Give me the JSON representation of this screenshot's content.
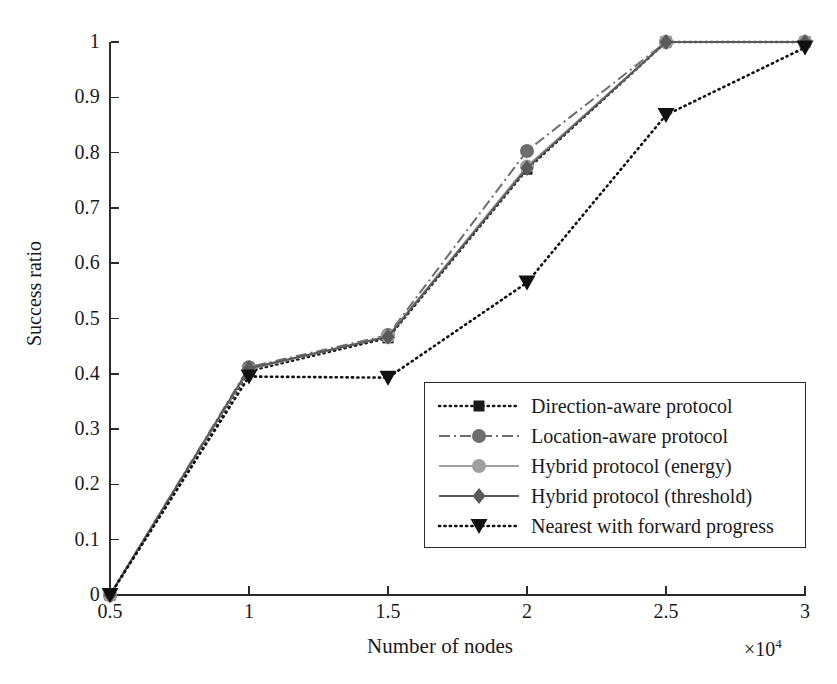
{
  "chart_data": {
    "type": "line",
    "title": "",
    "xlabel": "Number of nodes",
    "ylabel": "Success ratio",
    "x_exponent": "×10",
    "x_exponent_power": "4",
    "xlim": [
      0.5,
      3
    ],
    "ylim": [
      0,
      1
    ],
    "xticks": [
      "0.5",
      "1",
      "1.5",
      "2",
      "2.5",
      "3"
    ],
    "xtick_values": [
      0.5,
      1,
      1.5,
      2,
      2.5,
      3
    ],
    "yticks": [
      "0",
      "0.1",
      "0.2",
      "0.3",
      "0.4",
      "0.5",
      "0.6",
      "0.7",
      "0.8",
      "0.9",
      "1"
    ],
    "ytick_values": [
      0,
      0.1,
      0.2,
      0.3,
      0.4,
      0.5,
      0.6,
      0.7,
      0.8,
      0.9,
      1
    ],
    "grid": false,
    "legend_position": "lower right",
    "x": [
      0.5,
      1,
      1.5,
      2,
      2.5,
      3
    ],
    "series": [
      {
        "name": "Direction-aware protocol",
        "values": [
          0.0,
          0.405,
          0.465,
          0.77,
          1.0,
          1.0
        ],
        "color": "#1a1a1a",
        "marker": "square",
        "linestyle": "dotted"
      },
      {
        "name": "Location-aware protocol",
        "values": [
          0.0,
          0.412,
          0.47,
          0.803,
          1.0,
          1.0
        ],
        "color": "#6e6e6e",
        "marker": "circle",
        "linestyle": "dashdot"
      },
      {
        "name": "Hybrid protocol (energy)",
        "values": [
          0.0,
          0.408,
          0.468,
          0.775,
          1.0,
          1.0
        ],
        "color": "#9f9f9f",
        "marker": "circle",
        "linestyle": "solid"
      },
      {
        "name": "Hybrid protocol (threshold)",
        "values": [
          0.0,
          0.41,
          0.467,
          0.772,
          1.0,
          1.0
        ],
        "color": "#5a5a5a",
        "marker": "diamond",
        "linestyle": "solid"
      },
      {
        "name": "Nearest with forward progress",
        "values": [
          0.0,
          0.395,
          0.393,
          0.565,
          0.868,
          0.99
        ],
        "color": "#111111",
        "marker": "triangle-down",
        "linestyle": "dotted"
      }
    ]
  },
  "caption": ""
}
